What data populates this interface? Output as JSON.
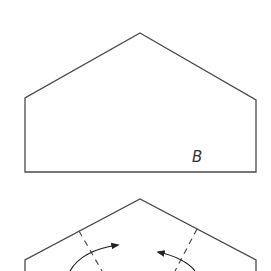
{
  "figure": {
    "top_shape": {
      "label": "B",
      "stroke": "#4a4a4a",
      "points": [
        [
          140,
          33
        ],
        [
          256,
          100
        ],
        [
          256,
          172
        ],
        [
          25,
          172
        ],
        [
          25,
          98
        ]
      ]
    },
    "bottom_shape": {
      "stroke": "#4a4a4a",
      "fold_lines": "dashed",
      "arrows": [
        "fold-left-arrow",
        "fold-right-arrow"
      ]
    }
  }
}
